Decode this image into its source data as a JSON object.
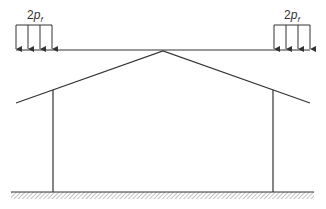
{
  "diagram": {
    "type": "portal frame with roof and suspended horizontal load",
    "loads": {
      "left": {
        "label_main": "2",
        "label_var": "p",
        "label_sub": "f",
        "arrow_count": 4
      },
      "right": {
        "label_main": "2",
        "label_var": "p",
        "label_sub": "f",
        "arrow_count": 4
      }
    },
    "colors": {
      "line": "#333333",
      "hatch": "#777777",
      "background": "#ffffff"
    }
  }
}
